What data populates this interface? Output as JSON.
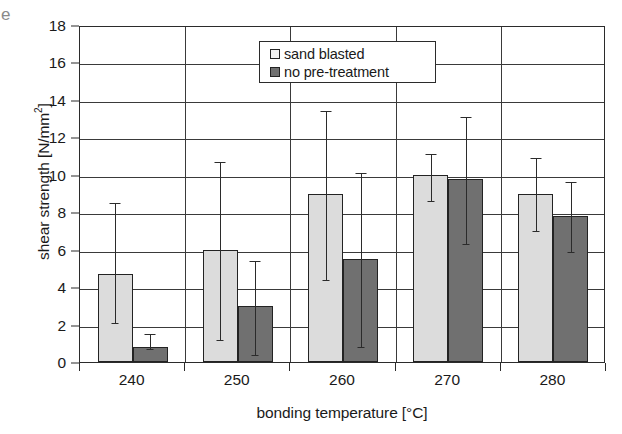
{
  "page_edge_glyph": "e",
  "chart_data": {
    "type": "bar",
    "title": "",
    "xlabel": "bonding temperature [°C]",
    "ylabel": "shear strength [N/mm²]",
    "ylabel_main": "shear strength [N/mm",
    "ylabel_sup": "2",
    "ylabel_tail": "]",
    "ylim": [
      0,
      18
    ],
    "ytick_step": 2,
    "yticks": [
      0,
      2,
      4,
      6,
      8,
      10,
      12,
      14,
      16,
      18
    ],
    "categories": [
      "240",
      "250",
      "260",
      "270",
      "280"
    ],
    "grid": "horizontal and vertical category separators",
    "legend_position": "top-center-right inside plot",
    "errorbar_type": "asymmetric min/max range",
    "series": [
      {
        "name": "sand blasted",
        "color": "#dcdcdc",
        "values": [
          4.7,
          6.0,
          9.0,
          10.0,
          9.0
        ],
        "err_low": [
          2.2,
          1.3,
          4.5,
          8.7,
          7.1
        ],
        "err_high": [
          8.6,
          10.8,
          13.5,
          11.2,
          11.0
        ]
      },
      {
        "name": "no pre-treatment",
        "color": "#707070",
        "values": [
          0.8,
          3.0,
          5.5,
          9.75,
          7.8
        ],
        "err_low": [
          0.8,
          0.5,
          0.9,
          6.4,
          6.0
        ],
        "err_high": [
          1.6,
          5.5,
          10.2,
          13.2,
          9.7
        ]
      }
    ]
  },
  "legend": {
    "items": [
      {
        "label": "sand blasted",
        "swatch": "light"
      },
      {
        "label": "no pre-treatment",
        "swatch": "dark"
      }
    ]
  }
}
